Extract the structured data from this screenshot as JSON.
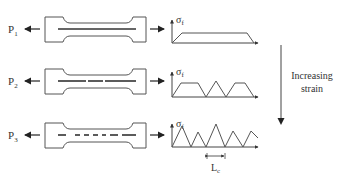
{
  "rows": [
    {
      "load_label": "P",
      "load_sub": "1",
      "axis_label": "σ",
      "axis_sub": "f",
      "fiber_segments": [
        [
          58,
          136
        ]
      ],
      "curve": "0,0 10,-10 75,-10 82,0"
    },
    {
      "load_label": "P",
      "load_sub": "2",
      "axis_label": "σ",
      "axis_sub": "f",
      "fiber_segments": [
        [
          58,
          86
        ],
        [
          88,
          103
        ],
        [
          105,
          136
        ]
      ],
      "curve": "0,0 9,-14 26,-14 34,0 44,-16 54,0 63,-14 73,-14 82,0"
    },
    {
      "load_label": "P",
      "load_sub": "3",
      "axis_label": "σ",
      "axis_sub": "f",
      "fiber_segments": [
        [
          58,
          66
        ],
        [
          75,
          80
        ],
        [
          84,
          89
        ],
        [
          93,
          98
        ],
        [
          102,
          106
        ],
        [
          110,
          118
        ],
        [
          122,
          136
        ]
      ],
      "curve": "0,0 10,-21 19,0 26,-15 34,0 44,-23 53,0 61,-16 71,0 79,-16 86,-9"
    }
  ],
  "strain_arrow": {
    "label_line1": "Increasing",
    "label_line2": "strain"
  },
  "critical_length": {
    "label": "L",
    "sub": "c"
  }
}
